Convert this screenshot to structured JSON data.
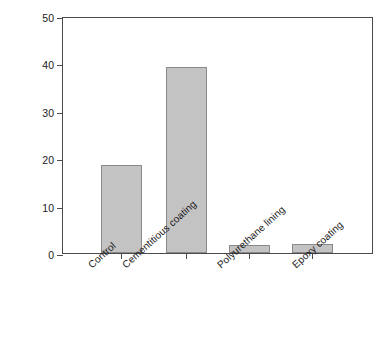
{
  "chart_data": {
    "type": "bar",
    "title": "",
    "xlabel": "",
    "ylabel": "MASS LOSS, g",
    "categories": [
      "Control",
      "Cementitious coating",
      "Polyurethane lining",
      "Epoxy coating"
    ],
    "values": [
      18.8,
      39.5,
      1.8,
      2.0
    ],
    "ylim": [
      0,
      50
    ],
    "yticks": [
      0,
      10,
      20,
      30,
      40,
      50
    ],
    "ytick_labels": [
      "0",
      "10",
      "20",
      "30",
      "40",
      "50"
    ],
    "grid": false,
    "legend": null,
    "bar_fill_color": "#c3c3c3",
    "bar_edge_color": "#8a8a8a",
    "axis_color": "#4a4a4a"
  },
  "axis": {
    "y_title": "MASS LOSS, g"
  },
  "caption": {
    "text": ""
  }
}
